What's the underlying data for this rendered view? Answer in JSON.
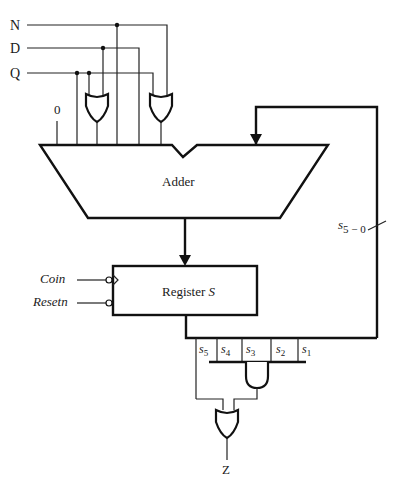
{
  "inputs": [
    {
      "label": "N"
    },
    {
      "label": "D"
    },
    {
      "label": "Q"
    }
  ],
  "constant_input": {
    "label": "0"
  },
  "adder": {
    "label": "Adder"
  },
  "register": {
    "label_prefix": "Register ",
    "label_var": "S"
  },
  "control_inputs": [
    {
      "label": "Coin"
    },
    {
      "label": "Resetn"
    }
  ],
  "bus": {
    "label_main": "s",
    "label_sub": "5 − 0"
  },
  "bits": [
    {
      "main": "s",
      "sub": "5"
    },
    {
      "main": "s",
      "sub": "4"
    },
    {
      "main": "s",
      "sub": "3"
    },
    {
      "main": "s",
      "sub": "2"
    },
    {
      "main": "s",
      "sub": "1"
    }
  ],
  "output": {
    "label": "Z"
  },
  "colors": {
    "line": "#111111",
    "background": "#ffffff"
  }
}
